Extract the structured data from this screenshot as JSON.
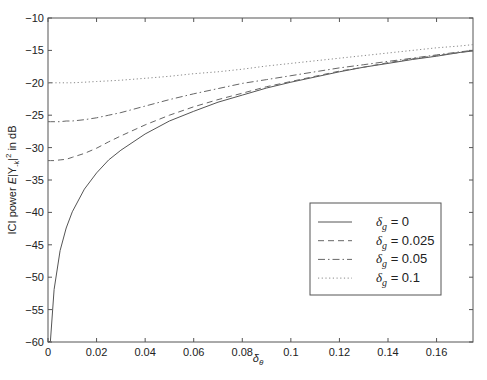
{
  "chart_data": {
    "type": "line",
    "title": "",
    "xlabel": "δ_θ",
    "xlabel_main": "δ",
    "xlabel_sub": "θ",
    "ylabel": "ICI power E|Y_-k|^2 in dB",
    "ylabel_parts": {
      "pre": "ICI power ",
      "E": "E",
      "mid": "|Y",
      "sub": "-k",
      "post": "|",
      "sup": "2",
      "tail": " in dB"
    },
    "xlim": [
      0,
      0.175
    ],
    "ylim": [
      -60,
      -10
    ],
    "xticks": [
      0,
      0.02,
      0.04,
      0.06,
      0.08,
      0.1,
      0.12,
      0.14,
      0.16
    ],
    "xtick_labels": [
      "0",
      "0.02",
      "0.04",
      "0.06",
      "0.08",
      "0.1",
      "0.12",
      "0.14",
      "0.16"
    ],
    "yticks": [
      -60,
      -55,
      -50,
      -45,
      -40,
      -35,
      -30,
      -25,
      -20,
      -15,
      -10
    ],
    "ytick_labels": [
      "−60",
      "−55",
      "−50",
      "−45",
      "−40",
      "−35",
      "−30",
      "−25",
      "−20",
      "−15",
      "−10"
    ],
    "grid": false,
    "legend_position": "lower right (inside)",
    "x": [
      0,
      0.001,
      0.0025,
      0.005,
      0.0075,
      0.01,
      0.015,
      0.02,
      0.025,
      0.03,
      0.04,
      0.05,
      0.06,
      0.07,
      0.08,
      0.09,
      0.1,
      0.11,
      0.12,
      0.13,
      0.14,
      0.15,
      0.16,
      0.17,
      0.175
    ],
    "series": [
      {
        "name": "δ_g = 0",
        "legend_main": "δ",
        "legend_sub": "g",
        "legend_value": " = 0",
        "style": "solid",
        "values": [
          -60,
          -59.9,
          -51.9,
          -45.9,
          -42.4,
          -39.9,
          -36.4,
          -33.9,
          -31.9,
          -30.4,
          -27.9,
          -25.9,
          -24.4,
          -23.0,
          -21.9,
          -20.8,
          -19.9,
          -19.1,
          -18.3,
          -17.6,
          -17.0,
          -16.4,
          -15.9,
          -15.3,
          -15.1
        ]
      },
      {
        "name": "δ_g = 0.025",
        "legend_main": "δ",
        "legend_sub": "g",
        "legend_value": " = 0.025",
        "style": "dashed",
        "values": [
          -32.0,
          -32.0,
          -32.0,
          -31.9,
          -31.8,
          -31.5,
          -30.9,
          -30.1,
          -29.1,
          -28.2,
          -26.5,
          -25.0,
          -23.7,
          -22.6,
          -21.6,
          -20.6,
          -19.8,
          -19.0,
          -18.2,
          -17.6,
          -16.9,
          -16.3,
          -15.8,
          -15.3,
          -15.0
        ]
      },
      {
        "name": "δ_g = 0.05",
        "legend_main": "δ",
        "legend_sub": "g",
        "legend_value": " = 0.05",
        "style": "dashdot",
        "values": [
          -26.0,
          -26.0,
          -26.0,
          -26.0,
          -25.9,
          -25.9,
          -25.7,
          -25.4,
          -25.0,
          -24.6,
          -23.6,
          -22.6,
          -21.7,
          -20.9,
          -20.1,
          -19.5,
          -18.9,
          -18.3,
          -17.7,
          -17.2,
          -16.7,
          -16.2,
          -15.7,
          -15.2,
          -15.0
        ]
      },
      {
        "name": "δ_g = 0.1",
        "legend_main": "δ",
        "legend_sub": "g",
        "legend_value": " = 0.1",
        "style": "dotted",
        "values": [
          -20.0,
          -20.0,
          -20.0,
          -20.0,
          -20.0,
          -20.0,
          -19.9,
          -19.8,
          -19.7,
          -19.6,
          -19.3,
          -19.0,
          -18.6,
          -18.3,
          -17.9,
          -17.4,
          -17.0,
          -16.6,
          -16.2,
          -15.8,
          -15.4,
          -15.0,
          -14.6,
          -14.3,
          -14.1
        ]
      }
    ]
  }
}
